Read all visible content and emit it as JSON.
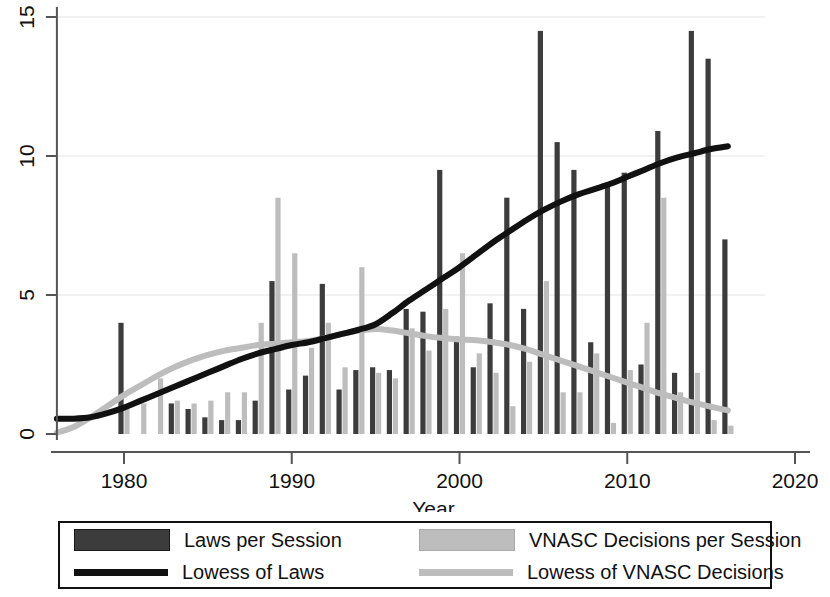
{
  "chart_data": {
    "type": "bar",
    "title": "",
    "xlabel": "Year",
    "ylabel": "",
    "xlim": [
      1976,
      2020
    ],
    "ylim": [
      0,
      15
    ],
    "xticks": [
      1980,
      1990,
      2000,
      2010,
      2020
    ],
    "yticks": [
      0,
      5,
      10,
      15
    ],
    "grid": false,
    "legend_position": "below-plot",
    "x": [
      1976,
      1977,
      1978,
      1979,
      1980,
      1981,
      1982,
      1983,
      1984,
      1985,
      1986,
      1987,
      1988,
      1989,
      1990,
      1991,
      1992,
      1993,
      1994,
      1995,
      1996,
      1997,
      1998,
      1999,
      2000,
      2001,
      2002,
      2003,
      2004,
      2005,
      2006,
      2007,
      2008,
      2009,
      2010,
      2011,
      2012,
      2013,
      2014,
      2015,
      2016
    ],
    "series": [
      {
        "name": "Laws per Session",
        "type": "bar",
        "color": "#3c3c3c",
        "values": [
          0,
          0,
          0,
          0,
          4.0,
          0,
          0,
          1.1,
          0.9,
          0.6,
          0.5,
          0.5,
          1.2,
          5.5,
          1.6,
          2.1,
          5.4,
          1.6,
          2.3,
          2.4,
          2.3,
          4.5,
          4.4,
          9.5,
          3.5,
          2.4,
          4.7,
          8.5,
          4.5,
          14.5,
          10.5,
          9.5,
          3.3,
          8.9,
          9.4,
          2.5,
          10.9,
          2.2,
          14.5,
          13.5,
          7.0
        ]
      },
      {
        "name": "VNASC Decisions per Session",
        "type": "bar",
        "color": "#bdbdbd",
        "values": [
          0,
          0,
          0,
          0,
          0.9,
          1.1,
          2.0,
          1.2,
          1.1,
          1.2,
          1.5,
          1.5,
          4.0,
          8.5,
          6.5,
          3.1,
          4.0,
          2.4,
          6.0,
          2.2,
          2.0,
          3.8,
          3.0,
          4.5,
          6.5,
          2.9,
          2.2,
          1.0,
          2.6,
          5.5,
          1.5,
          1.5,
          2.9,
          0.4,
          2.3,
          4.0,
          8.5,
          1.5,
          2.2,
          0.5,
          0.3
        ]
      },
      {
        "name": "Lowess of Laws",
        "type": "line",
        "color": "#111111",
        "values": [
          0.55,
          0.55,
          0.6,
          0.75,
          0.95,
          1.2,
          1.45,
          1.7,
          1.95,
          2.2,
          2.45,
          2.7,
          2.9,
          3.05,
          3.2,
          3.3,
          3.45,
          3.6,
          3.75,
          3.95,
          4.35,
          4.8,
          5.2,
          5.6,
          6.0,
          6.45,
          6.9,
          7.3,
          7.7,
          8.05,
          8.35,
          8.6,
          8.8,
          9.0,
          9.25,
          9.5,
          9.75,
          9.95,
          10.1,
          10.25,
          10.35
        ]
      },
      {
        "name": "Lowess of VNASC Decisions",
        "type": "line",
        "color": "#bdbdbd",
        "values": [
          0.05,
          0.25,
          0.6,
          1.0,
          1.4,
          1.75,
          2.1,
          2.4,
          2.65,
          2.85,
          3.0,
          3.1,
          3.2,
          3.25,
          3.3,
          3.35,
          3.45,
          3.6,
          3.72,
          3.78,
          3.72,
          3.62,
          3.52,
          3.45,
          3.4,
          3.37,
          3.3,
          3.2,
          3.05,
          2.85,
          2.65,
          2.45,
          2.25,
          2.05,
          1.85,
          1.65,
          1.45,
          1.28,
          1.12,
          0.98,
          0.85
        ]
      }
    ]
  },
  "legend": {
    "items": [
      {
        "label": "Laws per Session",
        "marker": "bar-swatch-dark"
      },
      {
        "label": "VNASC Decisions per Session",
        "marker": "bar-swatch-light"
      },
      {
        "label": "Lowess of Laws",
        "marker": "line-swatch-dark"
      },
      {
        "label": "Lowess of VNASC Decisions",
        "marker": "line-swatch-light"
      }
    ]
  },
  "colors": {
    "bar_dark": "#3c3c3c",
    "bar_light": "#bdbdbd",
    "line_dark": "#111111",
    "line_light": "#bdbdbd",
    "axis": "#555555",
    "background": "#ffffff"
  }
}
